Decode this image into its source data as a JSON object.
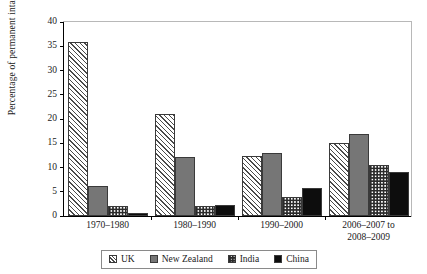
{
  "chart_data": {
    "type": "bar",
    "title": "",
    "subtitle": "",
    "xlabel": "",
    "ylabel": "Percentage of permanent intake",
    "ylim": [
      0,
      40
    ],
    "yticks": [
      0,
      5,
      10,
      15,
      20,
      25,
      30,
      35,
      40
    ],
    "ytick_labels": [
      "0",
      "5",
      "10",
      "15",
      "20",
      "25",
      "30",
      "35",
      "40"
    ],
    "grid": false,
    "legend_position": "bottom",
    "categories": [
      "1970–1980",
      "1980–1990",
      "1990–2000",
      "2006–2007 to\n2008–2009"
    ],
    "series": [
      {
        "name": "UK",
        "pattern": "diagonal-hatch",
        "color": "#4a4a4a",
        "values": [
          35.8,
          21.0,
          12.3,
          15.1
        ]
      },
      {
        "name": "New Zealand",
        "pattern": "solid-gray",
        "color": "#767676",
        "values": [
          6.1,
          12.2,
          13.0,
          17.0
        ]
      },
      {
        "name": "India",
        "pattern": "checkerboard",
        "color": "#2b2b2b",
        "values": [
          2.0,
          2.0,
          4.0,
          10.5
        ]
      },
      {
        "name": "China",
        "pattern": "solid-black",
        "color": "#0d0d0d",
        "values": [
          0.7,
          2.3,
          5.8,
          9.0
        ]
      }
    ]
  },
  "axis": {
    "y_title": "Percentage of permanent intake"
  },
  "legend": {
    "items": [
      {
        "label": "UK"
      },
      {
        "label": "New Zealand"
      },
      {
        "label": "India"
      },
      {
        "label": "China"
      }
    ]
  }
}
